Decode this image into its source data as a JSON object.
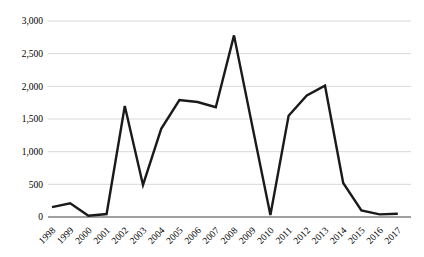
{
  "chart": {
    "background_color": "#ffffff",
    "series_line_color": "#1a1a1a",
    "series_line_width": 2.4,
    "gridline_color": "#d9d9d9",
    "baseline_color": "#808080",
    "label_color": "#000000"
  },
  "chart_data": {
    "type": "line",
    "title": "",
    "xlabel": "",
    "ylabel": "",
    "categories": [
      "1998",
      "1999",
      "2000",
      "2001",
      "2002",
      "2003",
      "2004",
      "2005",
      "2006",
      "2007",
      "2008",
      "2009",
      "2010",
      "2011",
      "2012",
      "2013",
      "2014",
      "2015",
      "2016",
      "2017"
    ],
    "series": [
      {
        "name": "value",
        "values": [
          150,
          210,
          20,
          45,
          1700,
          490,
          1350,
          1790,
          1760,
          1680,
          2780,
          1400,
          30,
          1550,
          1860,
          2010,
          520,
          100,
          40,
          50
        ]
      }
    ],
    "ylim": [
      0,
      3000
    ],
    "ytick_interval": 500,
    "ytick_labels": [
      "0",
      "500",
      "1,000",
      "1,500",
      "2,000",
      "2,500",
      "3,000"
    ],
    "xtick_rotation_deg": -45,
    "grid": "horizontal",
    "legend": "none",
    "markers": "none"
  }
}
